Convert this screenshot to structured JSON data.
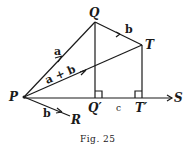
{
  "figure": {
    "caption": "Fig. 25",
    "points": {
      "P": "P",
      "Q": "Q",
      "T": "T",
      "Q_prime": "Q′",
      "T_prime": "T′",
      "S": "S",
      "R": "R"
    },
    "vectors": {
      "PQ": "a",
      "QT": "b",
      "PT": "a + b",
      "PR": "b"
    },
    "segment_labels": {
      "Q_prime_T_prime": "c"
    }
  }
}
